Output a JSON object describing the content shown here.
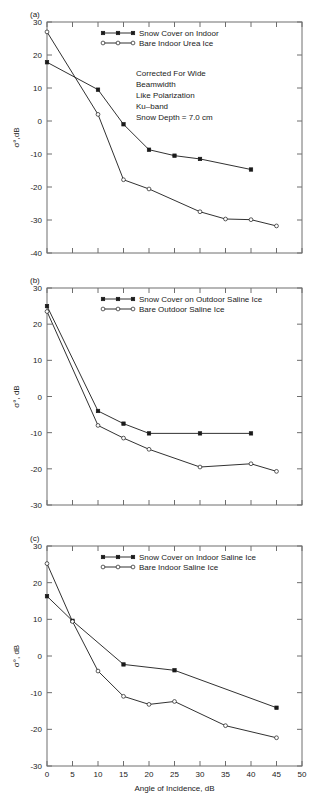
{
  "figure": {
    "xlabel": "Angle of Incidence, dB",
    "ylabel": "σ°, dB",
    "x_ticks": [
      0,
      5,
      10,
      15,
      20,
      25,
      30,
      35,
      40,
      45,
      50
    ],
    "xlim": [
      0,
      50
    ]
  },
  "panels": [
    {
      "label": "(a)",
      "ylim": [
        -40,
        30
      ],
      "y_ticks": [
        -40,
        -30,
        -20,
        -10,
        0,
        10,
        20,
        30
      ],
      "ylabel": "σ°,dB",
      "legend": [
        {
          "label": "Snow Cover on Indoor",
          "marker": "filled-square"
        },
        {
          "label": "Bare Indoor Urea Ice",
          "marker": "open-circle"
        }
      ],
      "annotation": [
        "Corrected For Wide",
        "Beamwidth",
        "Like Polarization",
        "Ku–band",
        "Snow Depth = 7.0 cm"
      ]
    },
    {
      "label": "(b)",
      "ylim": [
        -30,
        30
      ],
      "y_ticks": [
        -30,
        -20,
        -10,
        0,
        10,
        20,
        30
      ],
      "ylabel": "σ°, dB",
      "legend": [
        {
          "label": "Snow Cover on Outdoor Saline Ice",
          "marker": "filled-square"
        },
        {
          "label": "Bare Outdoor Saline Ice",
          "marker": "open-circle"
        }
      ],
      "annotation": []
    },
    {
      "label": "(c)",
      "ylim": [
        -30,
        30
      ],
      "y_ticks": [
        -30,
        -20,
        -10,
        0,
        10,
        20,
        30
      ],
      "ylabel": "σ°, dB",
      "legend": [
        {
          "label": "Snow Cover on Indoor Saline Ice",
          "marker": "filled-square"
        },
        {
          "label": "Bare Indoor Saline Ice",
          "marker": "open-circle"
        }
      ],
      "annotation": []
    }
  ],
  "chart_data": [
    {
      "type": "line",
      "panel": "(a)",
      "title": "",
      "xlabel": "Angle of Incidence, dB",
      "ylabel": "σ°,dB",
      "xlim": [
        0,
        50
      ],
      "ylim": [
        -40,
        30
      ],
      "grid": false,
      "legend_position": "top-center",
      "annotations": [
        "Corrected For Wide",
        "Beamwidth",
        "Like Polarization",
        "Ku–band",
        "Snow Depth = 7.0 cm"
      ],
      "series": [
        {
          "name": "Snow Cover on Indoor",
          "marker": "filled-square",
          "x": [
            0,
            10,
            15,
            20,
            25,
            30,
            40
          ],
          "y": [
            17.8,
            9.5,
            -1.0,
            -8.7,
            -10.5,
            -11.5,
            -14.7
          ]
        },
        {
          "name": "Bare Indoor Urea Ice",
          "marker": "open-circle",
          "x": [
            0,
            10,
            15,
            20,
            30,
            35,
            40,
            45
          ],
          "y": [
            27.0,
            2.0,
            -17.8,
            -20.6,
            -27.5,
            -29.7,
            -29.9,
            -31.8
          ]
        }
      ]
    },
    {
      "type": "line",
      "panel": "(b)",
      "title": "",
      "xlabel": "Angle of Incidence, dB",
      "ylabel": "σ°, dB",
      "xlim": [
        0,
        50
      ],
      "ylim": [
        -30,
        30
      ],
      "grid": false,
      "legend_position": "top-center",
      "annotations": [],
      "series": [
        {
          "name": "Snow Cover on Outdoor Saline Ice",
          "marker": "filled-square",
          "x": [
            0,
            10,
            15,
            20,
            30,
            40
          ],
          "y": [
            25.0,
            -4.0,
            -7.5,
            -10.2,
            -10.2,
            -10.2
          ]
        },
        {
          "name": "Bare Outdoor Saline Ice",
          "marker": "open-circle",
          "x": [
            0,
            10,
            15,
            20,
            30,
            40,
            45
          ],
          "y": [
            23.5,
            -8.0,
            -11.5,
            -14.6,
            -19.5,
            -18.6,
            -20.7
          ]
        }
      ]
    },
    {
      "type": "line",
      "panel": "(c)",
      "title": "",
      "xlabel": "Angle of Incidence, dB",
      "ylabel": "σ°, dB",
      "xlim": [
        0,
        50
      ],
      "ylim": [
        -30,
        30
      ],
      "grid": false,
      "legend_position": "top-center",
      "annotations": [],
      "series": [
        {
          "name": "Snow Cover on Indoor Saline Ice",
          "marker": "filled-square",
          "x": [
            0,
            5,
            15,
            25,
            45
          ],
          "y": [
            16.3,
            9.6,
            -2.3,
            -3.9,
            -14.1
          ]
        },
        {
          "name": "Bare Indoor Saline Ice",
          "marker": "open-circle",
          "x": [
            0,
            5,
            10,
            15,
            20,
            25,
            35,
            45
          ],
          "y": [
            25.2,
            9.4,
            -4.1,
            -11.0,
            -13.2,
            -12.4,
            -19.0,
            -22.3
          ]
        }
      ]
    }
  ]
}
